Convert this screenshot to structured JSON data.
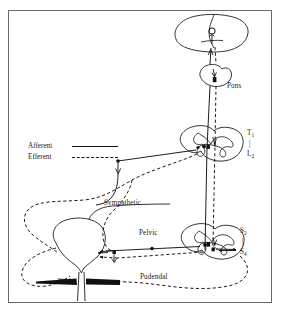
{
  "figure": {
    "frame_color": "#6a6a6a",
    "background_color": "#ffffff",
    "line_color": "#111111"
  },
  "legend": {
    "items": [
      {
        "label": "Afferent",
        "line_style": "solid"
      },
      {
        "label": "Efferent",
        "line_style": "dashed"
      }
    ]
  },
  "labels": {
    "pons": "Pons",
    "thoracolumbar_top": "T",
    "thoracolumbar_top_sub": "1",
    "thoracolumbar_dash": "|",
    "thoracolumbar_bottom": "L",
    "thoracolumbar_bottom_sub": "2",
    "sacral_top": "S",
    "sacral_top_sub": "2",
    "sacral_dash": "|",
    "sacral_bottom": "S",
    "sacral_bottom_sub": "4",
    "sympathetic": "Sympathetic",
    "pelvic": "Pelvic",
    "pudendal": "Pudendal"
  },
  "structures": {
    "cerebrum": "cerebrum-outline",
    "pons": "pons-outline",
    "thoracolumbar_cord": "thoracolumbar-spinal-cord-cross-section",
    "sacral_cord": "sacral-spinal-cord-cross-section",
    "bladder": "bladder-outline",
    "urethra": "urethra",
    "pelvic_floor": "pelvic-floor-muscle"
  }
}
